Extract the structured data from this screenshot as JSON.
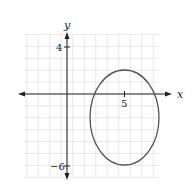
{
  "chart_data": {
    "type": "line",
    "title": "",
    "xlabel": "x",
    "ylabel": "y",
    "xlim": [
      -3.5,
      8
    ],
    "ylim": [
      -7,
      5
    ],
    "grid": true,
    "legend": null,
    "tick_labels": {
      "x": [
        {
          "value": 5,
          "label": "5"
        }
      ],
      "y": [
        {
          "value": 4,
          "label": "4"
        },
        {
          "value": -6,
          "label": "−6"
        }
      ]
    },
    "series": [
      {
        "name": "ellipse",
        "shape": "ellipse",
        "center": [
          5,
          -2
        ],
        "semi_axis_x": 3,
        "semi_axis_y": 4,
        "equation": "(x-5)^2/9 + (y+2)^2/16 = 1",
        "key_points": [
          {
            "x": 5,
            "y": 2
          },
          {
            "x": 5,
            "y": -6
          },
          {
            "x": 2,
            "y": -2
          },
          {
            "x": 8,
            "y": -2
          }
        ]
      }
    ]
  },
  "labels": {
    "x_axis": "x",
    "y_axis": "y",
    "x_tick_5": "5",
    "y_tick_4": "4",
    "y_tick_neg6": "−6"
  },
  "colors": {
    "grid": "#d9d9d9",
    "axes": "#222222",
    "curve": "#555555"
  }
}
